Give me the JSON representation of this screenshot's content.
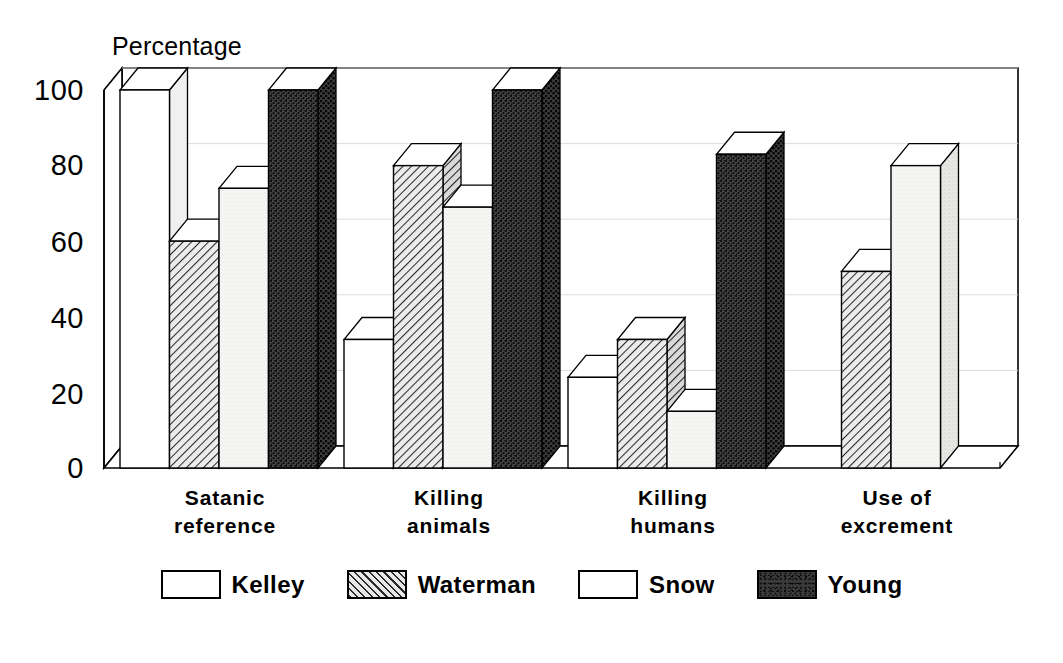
{
  "chart_data": {
    "type": "bar",
    "title": "",
    "ylabel": "Percentage",
    "xlabel": "",
    "ylim": [
      0,
      100
    ],
    "yticks": [
      0,
      20,
      40,
      60,
      80,
      100
    ],
    "grid": false,
    "legend_position": "bottom",
    "style": "3d-grouped-bar",
    "categories": [
      "Satanic\nreference",
      "Killing\nanimals",
      "Killing\nhumans",
      "Use of\nexcrement"
    ],
    "series": [
      {
        "name": "Kelley",
        "fill": "white",
        "values": [
          100,
          34,
          24,
          0
        ]
      },
      {
        "name": "Waterman",
        "fill": "hatch",
        "values": [
          60,
          80,
          34,
          52
        ]
      },
      {
        "name": "Snow",
        "fill": "light",
        "values": [
          74,
          69,
          15,
          80
        ]
      },
      {
        "name": "Young",
        "fill": "dark",
        "values": [
          100,
          100,
          83,
          0
        ]
      }
    ]
  },
  "axis": {
    "y_title": "Percentage",
    "tick_labels": [
      "100",
      "80",
      "60",
      "40",
      "20",
      "0"
    ]
  },
  "legend": {
    "items": [
      {
        "label": "Kelley"
      },
      {
        "label": "Waterman"
      },
      {
        "label": "Snow"
      },
      {
        "label": "Young"
      }
    ]
  },
  "categories": [
    {
      "line1": "Satanic",
      "line2": "reference"
    },
    {
      "line1": "Killing",
      "line2": "animals"
    },
    {
      "line1": "Killing",
      "line2": "humans"
    },
    {
      "line1": "Use of",
      "line2": "excrement"
    }
  ],
  "colors": {
    "ink": "#000000",
    "background": "#ffffff",
    "dark_fill": "#3a3a3a",
    "hatch_fill": "#e8e8e8",
    "light_fill": "#f4f4f2"
  }
}
